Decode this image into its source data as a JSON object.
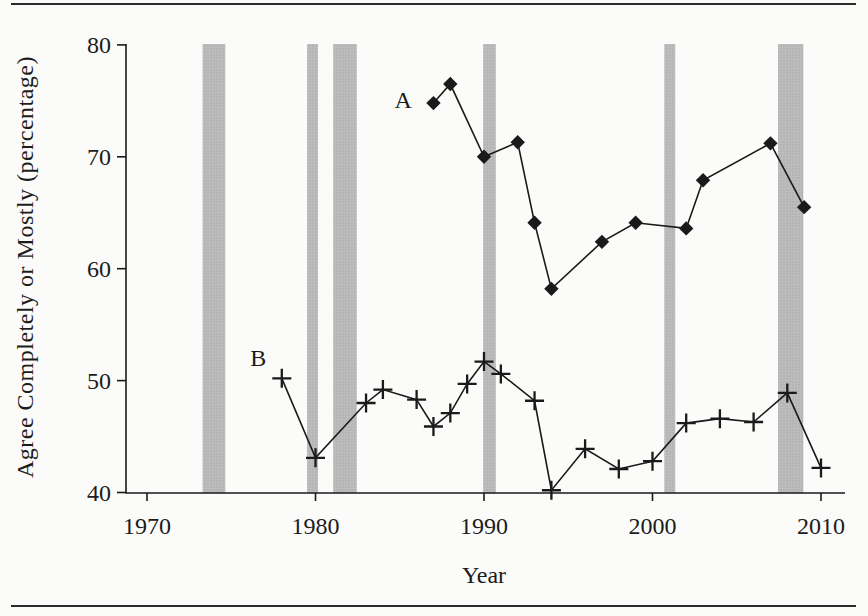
{
  "figure": {
    "background": "#fbfbf9",
    "frame_rule_color": "#2b2b2b"
  },
  "chart_data": {
    "type": "line",
    "title": "",
    "xlabel": "Year",
    "ylabel": "Agree Completely or Mostly (percentage)",
    "xlim": [
      1968.8,
      2011.4
    ],
    "ylim": [
      40,
      80
    ],
    "x_ticks": [
      1970,
      1980,
      1990,
      2000,
      2010
    ],
    "y_ticks": [
      40,
      50,
      60,
      70,
      80
    ],
    "grid": false,
    "legend_position": "inline-labels",
    "line_color": "#1a1a1a",
    "band_color": "#bcbcbc",
    "recession_bands": [
      [
        1973.3,
        1974.65
      ],
      [
        1979.5,
        1980.15
      ],
      [
        1981.05,
        1982.45
      ],
      [
        1989.95,
        1990.7
      ],
      [
        2000.7,
        2001.35
      ],
      [
        2007.45,
        2008.95
      ]
    ],
    "series": [
      {
        "name": "A",
        "marker": "diamond",
        "label_pos": {
          "year": 1985.2,
          "value": 75.1
        },
        "points": [
          [
            1987,
            74.8
          ],
          [
            1988,
            76.5
          ],
          [
            1990,
            70.0
          ],
          [
            1992,
            71.3
          ],
          [
            1993,
            64.1
          ],
          [
            1994,
            58.2
          ],
          [
            1997,
            62.4
          ],
          [
            1999,
            64.1
          ],
          [
            2002,
            63.6
          ],
          [
            2003,
            67.9
          ],
          [
            2007,
            71.2
          ],
          [
            2009,
            65.5
          ]
        ]
      },
      {
        "name": "B",
        "marker": "plus",
        "label_pos": {
          "year": 1976.6,
          "value": 52.0
        },
        "points": [
          [
            1978,
            50.2
          ],
          [
            1980,
            43.1
          ],
          [
            1983,
            48.0
          ],
          [
            1984,
            49.2
          ],
          [
            1986,
            48.3
          ],
          [
            1987,
            45.9
          ],
          [
            1988,
            47.1
          ],
          [
            1989,
            49.7
          ],
          [
            1990,
            51.7
          ],
          [
            1991,
            50.6
          ],
          [
            1993,
            48.2
          ],
          [
            1994,
            40.2
          ],
          [
            1996,
            43.9
          ],
          [
            1998,
            42.1
          ],
          [
            2000,
            42.8
          ],
          [
            2002,
            46.2
          ],
          [
            2004,
            46.6
          ],
          [
            2006,
            46.3
          ],
          [
            2008,
            48.9
          ],
          [
            2010,
            42.2
          ]
        ]
      }
    ]
  }
}
